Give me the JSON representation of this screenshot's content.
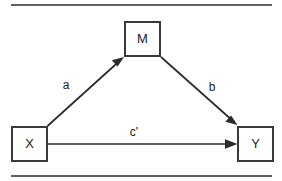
{
  "figure": {
    "type": "mediation-path-diagram",
    "background_color": "#ffffff",
    "line_color": "#2b2b2b",
    "box_border_color": "#3a3a3a",
    "text_color": "#1c1c1c",
    "top_rule_label": "",
    "bottom_rule_label": ""
  },
  "nodes": {
    "mediator": {
      "label": "M",
      "x": 124,
      "y": 21,
      "w": 37,
      "h": 36
    },
    "predictor": {
      "label": "X",
      "x": 11,
      "y": 126,
      "w": 37,
      "h": 36
    },
    "outcome": {
      "label": "Y",
      "x": 237,
      "y": 126,
      "w": 37,
      "h": 36
    }
  },
  "paths": {
    "a": {
      "label": "a",
      "from": "X",
      "to": "M",
      "label_x": 66,
      "label_y": 86
    },
    "b": {
      "label": "b",
      "from": "M",
      "to": "Y",
      "label_x": 212,
      "label_y": 88
    },
    "c_prime": {
      "label": "c'",
      "from": "X",
      "to": "Y",
      "label_x": 134,
      "label_y": 133
    }
  }
}
